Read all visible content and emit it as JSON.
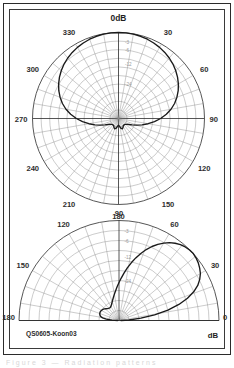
{
  "figure": {
    "caption_id": "QS0605-Koon03",
    "unit_label": "dB",
    "ghost_caption": "Figure 3 — Radiation patterns"
  },
  "chart_data": [
    {
      "type": "polar",
      "name": "azimuth-pattern",
      "title": "0dB",
      "title_position": "top",
      "angle_unit": "degrees",
      "angle_range": [
        0,
        360
      ],
      "angle_labels": [
        "0dB",
        "30",
        "60",
        "90",
        "120",
        "150",
        "180",
        "210",
        "240",
        "270",
        "300",
        "330"
      ],
      "angle_label_values": [
        0,
        30,
        60,
        90,
        120,
        150,
        180,
        210,
        240,
        270,
        300,
        330
      ],
      "radial_labels": [
        "-3",
        "-6",
        "-12",
        "-24"
      ],
      "radial_label_values": [
        -3,
        -6,
        -12,
        -24
      ],
      "radial_label_fracs": [
        0.891,
        0.794,
        0.631,
        0.398
      ],
      "rings": 10,
      "spoke_step_deg": 10,
      "grid": true,
      "r_outer_db": 0,
      "series": [
        {
          "name": "E-plane azimuth",
          "points_deg_frac": [
            [
              0,
              1.0
            ],
            [
              5,
              0.999
            ],
            [
              10,
              0.996
            ],
            [
              15,
              0.99
            ],
            [
              20,
              0.981
            ],
            [
              25,
              0.969
            ],
            [
              30,
              0.955
            ],
            [
              35,
              0.938
            ],
            [
              40,
              0.918
            ],
            [
              45,
              0.895
            ],
            [
              50,
              0.868
            ],
            [
              55,
              0.838
            ],
            [
              60,
              0.804
            ],
            [
              65,
              0.766
            ],
            [
              70,
              0.723
            ],
            [
              75,
              0.675
            ],
            [
              80,
              0.62
            ],
            [
              85,
              0.558
            ],
            [
              90,
              0.49
            ],
            [
              95,
              0.42
            ],
            [
              100,
              0.35
            ],
            [
              105,
              0.284
            ],
            [
              110,
              0.225
            ],
            [
              115,
              0.175
            ],
            [
              120,
              0.14
            ],
            [
              125,
              0.118
            ],
            [
              130,
              0.106
            ],
            [
              135,
              0.1
            ],
            [
              140,
              0.098
            ],
            [
              145,
              0.1
            ],
            [
              150,
              0.108
            ],
            [
              155,
              0.12
            ],
            [
              160,
              0.128
            ],
            [
              165,
              0.12
            ],
            [
              170,
              0.1
            ],
            [
              175,
              0.085
            ],
            [
              180,
              0.08
            ],
            [
              185,
              0.085
            ],
            [
              190,
              0.1
            ],
            [
              195,
              0.12
            ],
            [
              200,
              0.128
            ],
            [
              205,
              0.12
            ],
            [
              210,
              0.108
            ],
            [
              215,
              0.1
            ],
            [
              220,
              0.098
            ],
            [
              225,
              0.1
            ],
            [
              230,
              0.106
            ],
            [
              235,
              0.118
            ],
            [
              240,
              0.14
            ],
            [
              245,
              0.175
            ],
            [
              250,
              0.225
            ],
            [
              255,
              0.284
            ],
            [
              260,
              0.35
            ],
            [
              265,
              0.42
            ],
            [
              270,
              0.49
            ],
            [
              275,
              0.558
            ],
            [
              280,
              0.62
            ],
            [
              285,
              0.675
            ],
            [
              290,
              0.723
            ],
            [
              295,
              0.766
            ],
            [
              300,
              0.804
            ],
            [
              305,
              0.838
            ],
            [
              310,
              0.868
            ],
            [
              315,
              0.895
            ],
            [
              320,
              0.918
            ],
            [
              325,
              0.938
            ],
            [
              330,
              0.955
            ],
            [
              335,
              0.969
            ],
            [
              340,
              0.981
            ],
            [
              345,
              0.99
            ],
            [
              350,
              0.996
            ],
            [
              355,
              0.999
            ],
            [
              360,
              1.0
            ]
          ]
        }
      ]
    },
    {
      "type": "polar-half",
      "name": "elevation-pattern",
      "angle_unit": "degrees",
      "angle_range": [
        0,
        180
      ],
      "angle_labels": [
        "0",
        "30",
        "60",
        "90",
        "120",
        "150",
        "180"
      ],
      "angle_label_values": [
        0,
        30,
        60,
        90,
        120,
        150,
        180
      ],
      "radial_labels": [
        "-3",
        "-6",
        "-12",
        "-24"
      ],
      "radial_label_values": [
        -3,
        -6,
        -12,
        -24
      ],
      "radial_label_fracs": [
        0.891,
        0.794,
        0.631,
        0.398
      ],
      "rings": 10,
      "spoke_step_deg": 10,
      "grid": true,
      "r_outer_db": 0,
      "series": [
        {
          "name": "Elevation pattern over ground",
          "points_deg_frac": [
            [
              0,
              0.02
            ],
            [
              3,
              0.1
            ],
            [
              6,
              0.22
            ],
            [
              9,
              0.36
            ],
            [
              12,
              0.5
            ],
            [
              15,
              0.62
            ],
            [
              18,
              0.72
            ],
            [
              21,
              0.8
            ],
            [
              24,
              0.862
            ],
            [
              27,
              0.906
            ],
            [
              30,
              0.94
            ],
            [
              33,
              0.962
            ],
            [
              36,
              0.98
            ],
            [
              39,
              0.992
            ],
            [
              42,
              1.0
            ],
            [
              45,
              0.998
            ],
            [
              48,
              0.99
            ],
            [
              51,
              0.976
            ],
            [
              54,
              0.955
            ],
            [
              57,
              0.928
            ],
            [
              60,
              0.894
            ],
            [
              63,
              0.855
            ],
            [
              66,
              0.81
            ],
            [
              69,
              0.76
            ],
            [
              72,
              0.705
            ],
            [
              75,
              0.648
            ],
            [
              78,
              0.59
            ],
            [
              81,
              0.532
            ],
            [
              84,
              0.476
            ],
            [
              87,
              0.425
            ],
            [
              90,
              0.38
            ],
            [
              93,
              0.34
            ],
            [
              96,
              0.305
            ],
            [
              99,
              0.275
            ],
            [
              102,
              0.25
            ],
            [
              105,
              0.228
            ],
            [
              108,
              0.21
            ],
            [
              111,
              0.194
            ],
            [
              114,
              0.18
            ],
            [
              117,
              0.17
            ],
            [
              120,
              0.162
            ],
            [
              123,
              0.158
            ],
            [
              126,
              0.156
            ],
            [
              129,
              0.158
            ],
            [
              132,
              0.162
            ],
            [
              135,
              0.168
            ],
            [
              138,
              0.176
            ],
            [
              141,
              0.184
            ],
            [
              144,
              0.192
            ],
            [
              147,
              0.198
            ],
            [
              150,
              0.203
            ],
            [
              153,
              0.206
            ],
            [
              156,
              0.207
            ],
            [
              159,
              0.206
            ],
            [
              162,
              0.202
            ],
            [
              165,
              0.196
            ],
            [
              168,
              0.186
            ],
            [
              171,
              0.166
            ],
            [
              174,
              0.128
            ],
            [
              177,
              0.07
            ],
            [
              180,
              0.015
            ]
          ]
        }
      ]
    }
  ]
}
